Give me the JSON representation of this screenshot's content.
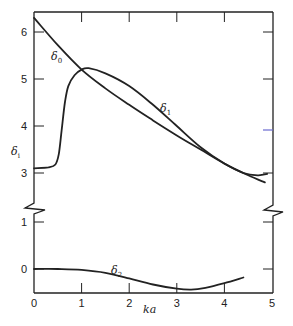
{
  "chart_data": {
    "type": "line",
    "title": "",
    "xlabel": "ka",
    "ylabel": "δ_i",
    "xlim": [
      0,
      5
    ],
    "x_ticks": [
      0,
      1,
      2,
      3,
      4,
      5
    ],
    "y_axis_broken": true,
    "y_segments": [
      {
        "name": "upper",
        "range": [
          2.6,
          6.43
        ],
        "ticks": [
          3,
          4,
          5,
          6
        ]
      },
      {
        "name": "lower",
        "range": [
          -0.5,
          1.3
        ],
        "ticks": [
          0,
          1
        ]
      }
    ],
    "grid": false,
    "legend": "none (curves labeled inline)",
    "series": [
      {
        "name": "δ0",
        "label_base": "δ",
        "label_sub": "0",
        "points": [
          [
            0,
            6.3
          ],
          [
            0.5,
            5.72
          ],
          [
            1.0,
            5.2
          ],
          [
            1.5,
            4.8
          ],
          [
            2.0,
            4.45
          ],
          [
            2.5,
            4.12
          ],
          [
            3.0,
            3.8
          ],
          [
            3.5,
            3.5
          ],
          [
            4.0,
            3.2
          ],
          [
            4.5,
            2.95
          ],
          [
            4.85,
            2.8
          ]
        ]
      },
      {
        "name": "δ1",
        "label_base": "δ",
        "label_sub": "1",
        "points": [
          [
            0,
            3.1
          ],
          [
            0.3,
            3.12
          ],
          [
            0.45,
            3.18
          ],
          [
            0.52,
            3.4
          ],
          [
            0.58,
            3.9
          ],
          [
            0.65,
            4.5
          ],
          [
            0.72,
            4.85
          ],
          [
            0.85,
            5.08
          ],
          [
            1.0,
            5.2
          ],
          [
            1.15,
            5.23
          ],
          [
            1.5,
            5.12
          ],
          [
            2.0,
            4.85
          ],
          [
            2.5,
            4.45
          ],
          [
            3.0,
            4.0
          ],
          [
            3.5,
            3.55
          ],
          [
            4.0,
            3.2
          ],
          [
            4.4,
            3.0
          ],
          [
            4.7,
            2.95
          ],
          [
            4.9,
            2.98
          ]
        ]
      },
      {
        "name": "δ2",
        "label_base": "δ",
        "label_sub": "2",
        "points": [
          [
            0,
            0.0
          ],
          [
            0.5,
            0.0
          ],
          [
            1.0,
            -0.02
          ],
          [
            1.5,
            -0.08
          ],
          [
            2.0,
            -0.2
          ],
          [
            2.5,
            -0.33
          ],
          [
            3.0,
            -0.42
          ],
          [
            3.3,
            -0.44
          ],
          [
            3.6,
            -0.4
          ],
          [
            4.0,
            -0.3
          ],
          [
            4.4,
            -0.18
          ]
        ]
      }
    ],
    "annotations": [
      {
        "text": "δ0",
        "at": [
          0.35,
          5.55
        ]
      },
      {
        "text": "δ1",
        "at": [
          2.65,
          4.55
        ]
      },
      {
        "text": "δ2",
        "at": [
          1.7,
          -0.08
        ]
      }
    ]
  },
  "axes": {
    "x_tick_labels": [
      "0",
      "1",
      "2",
      "3",
      "4",
      "5"
    ],
    "y_tick_labels_upper": [
      "6",
      "5",
      "4",
      "3"
    ],
    "y_tick_labels_lower": [
      "1",
      "0"
    ],
    "xlabel": "ka",
    "ylabel_base": "δ",
    "ylabel_sub": "i"
  },
  "labels": {
    "d0_base": "δ",
    "d0_sub": "0",
    "d1_base": "δ",
    "d1_sub": "1",
    "d2_base": "δ",
    "d2_sub": "2"
  },
  "colors": {
    "ink": "#222222",
    "stray_tick": "#6b6bd0"
  }
}
